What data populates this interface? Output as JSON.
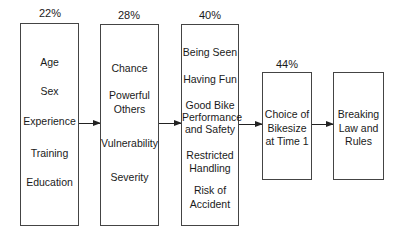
{
  "diagram": {
    "boxes": [
      {
        "percent": "22%",
        "items": [
          "Age",
          "Sex",
          "Experience",
          "Training",
          "Education"
        ]
      },
      {
        "percent": "28%",
        "items": [
          "Chance",
          "Powerful",
          "Others",
          "Vulnerability",
          "Severity"
        ]
      },
      {
        "percent": "40%",
        "items": [
          "Being Seen",
          "Having Fun",
          "Good Bike",
          "Performance",
          "and Safety",
          "Restricted",
          "Handling",
          "Risk of",
          "Accident"
        ]
      },
      {
        "percent": "44%",
        "items": [
          "Choice of",
          "Bikesize",
          "at Time 1"
        ]
      },
      {
        "percent": "",
        "items": [
          "Breaking",
          "Law and",
          "Rules"
        ]
      }
    ],
    "arrows": [
      "box1-to-box2",
      "box2-to-box3",
      "box3-to-box4",
      "box4-to-box5"
    ]
  }
}
